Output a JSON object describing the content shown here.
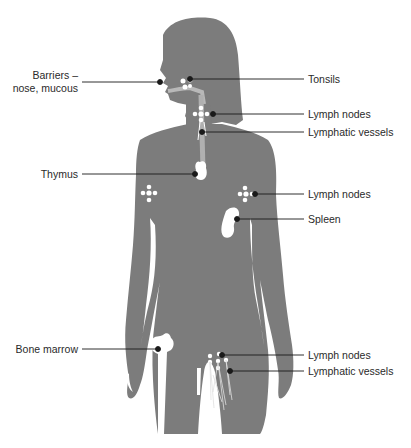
{
  "diagram": {
    "colors": {
      "silhouette": "#7c7c7c",
      "organ": "#ffffff",
      "leader_line": "#1a1a1a",
      "text": "#2a2a2a",
      "background": "#ffffff"
    },
    "labels": {
      "barriers_line1": "Barriers –",
      "barriers_line2": "nose, mucous",
      "thymus": "Thymus",
      "bone_marrow": "Bone marrow",
      "tonsils": "Tonsils",
      "lymph_nodes_neck": "Lymph nodes",
      "lymphatic_vessels_neck": "Lymphatic vessels",
      "lymph_nodes_armpit": "Lymph nodes",
      "spleen": "Spleen",
      "lymph_nodes_groin": "Lymph nodes",
      "lymphatic_vessels_leg": "Lymphatic vessels"
    }
  }
}
